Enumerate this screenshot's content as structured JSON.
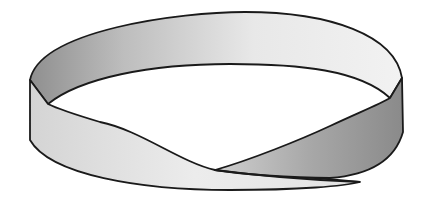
{
  "figure": {
    "subject": "Möbius strip",
    "colors": {
      "background": "#ffffff",
      "outline": "#1a1a1a",
      "light_face": "#e6e6e6",
      "mid_face": "#cfcfcf",
      "dark_face": "#9a9a9a"
    }
  }
}
